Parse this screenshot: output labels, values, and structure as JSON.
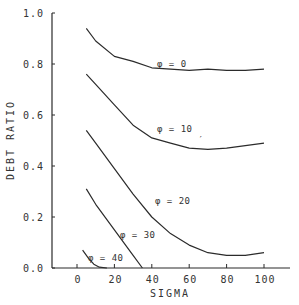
{
  "chart_data": {
    "type": "line",
    "title": "",
    "xlabel": "SIGMA",
    "ylabel": "DEBT RATIO",
    "xlim": [
      -15,
      115
    ],
    "ylim": [
      0.0,
      1.0
    ],
    "x_ticks": [
      0,
      20,
      40,
      60,
      80,
      100
    ],
    "x_tick_labels": [
      "0",
      "20",
      "40",
      "60",
      "80",
      "100"
    ],
    "y_ticks": [
      0.0,
      0.2,
      0.4,
      0.6,
      0.8,
      1.0
    ],
    "y_tick_labels": [
      "0.0",
      "0.2",
      "0.4",
      "0.6",
      "0.8",
      "1.0"
    ],
    "grid": false,
    "legend": "none (curves labeled inline)",
    "series": [
      {
        "name": "φ = 0",
        "label": "φ = 0",
        "x": [
          5,
          10,
          20,
          30,
          40,
          50,
          60,
          70,
          80,
          90,
          100
        ],
        "y": [
          0.94,
          0.89,
          0.83,
          0.81,
          0.785,
          0.78,
          0.775,
          0.78,
          0.775,
          0.775,
          0.78
        ]
      },
      {
        "name": "φ = 10",
        "label": "φ = 10",
        "x": [
          5,
          10,
          20,
          30,
          40,
          50,
          60,
          70,
          80,
          90,
          100
        ],
        "y": [
          0.76,
          0.72,
          0.64,
          0.56,
          0.51,
          0.49,
          0.47,
          0.465,
          0.47,
          0.48,
          0.49
        ]
      },
      {
        "name": "φ = 20",
        "label": "φ = 20",
        "x": [
          5,
          10,
          20,
          30,
          40,
          50,
          60,
          70,
          80,
          90,
          100
        ],
        "y": [
          0.54,
          0.49,
          0.39,
          0.29,
          0.2,
          0.135,
          0.09,
          0.06,
          0.05,
          0.05,
          0.06
        ]
      },
      {
        "name": "φ = 30",
        "label": "φ = 30",
        "x": [
          5,
          10,
          20,
          30,
          35
        ],
        "y": [
          0.31,
          0.25,
          0.15,
          0.05,
          0.0
        ]
      },
      {
        "name": "φ = 40",
        "label": "φ = 40",
        "x": [
          3,
          6,
          9,
          12,
          16
        ],
        "y": [
          0.07,
          0.04,
          0.015,
          0.003,
          0.0
        ]
      }
    ]
  },
  "annotations": [
    {
      "text": "′",
      "note": "stray mark near φ = 10 curve",
      "x": 62,
      "y": 0.5
    }
  ],
  "style": {
    "line_color": "#2b2b2b",
    "text_color": "#333333",
    "background": "#ffffff"
  }
}
